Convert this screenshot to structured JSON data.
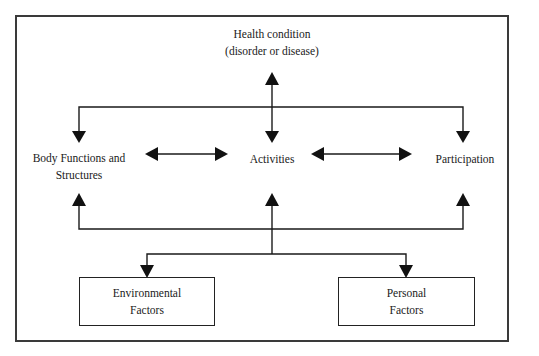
{
  "diagram": {
    "nodes": {
      "health_condition": {
        "line1": "Health  condition",
        "line2": "(disorder or disease)"
      },
      "body_functions": {
        "line1": "Body Functions  and",
        "line2": "Structures"
      },
      "activities": {
        "line1": "Activities"
      },
      "participation": {
        "line1": "Participation"
      },
      "environmental_factors": {
        "line1": "Environmental",
        "line2": "Factors"
      },
      "personal_factors": {
        "line1": "Personal",
        "line2": "Factors"
      }
    },
    "edges": [
      {
        "from": "health_condition",
        "to": "activities",
        "type": "bidirectional"
      },
      {
        "from": "health_condition",
        "to": "body_functions",
        "type": "directed"
      },
      {
        "from": "health_condition",
        "to": "participation",
        "type": "directed"
      },
      {
        "from": "body_functions",
        "to": "activities",
        "type": "bidirectional"
      },
      {
        "from": "activities",
        "to": "participation",
        "type": "bidirectional"
      },
      {
        "from": "environmental_factors",
        "to": "body_functions",
        "type": "directed"
      },
      {
        "from": "environmental_factors",
        "to": "activities",
        "type": "directed"
      },
      {
        "from": "environmental_factors",
        "to": "participation",
        "type": "directed"
      },
      {
        "from": "contextual_bus",
        "to": "environmental_factors",
        "type": "directed"
      },
      {
        "from": "contextual_bus",
        "to": "personal_factors",
        "type": "directed"
      }
    ],
    "colors": {
      "line": "#1a1a1a",
      "frame": "#3a3a3a",
      "background": "#ffffff"
    }
  }
}
